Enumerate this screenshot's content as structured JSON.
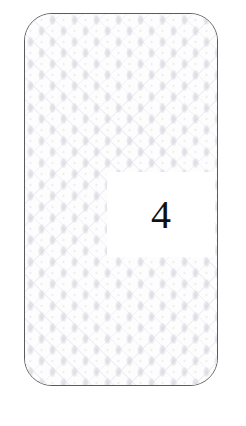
{
  "canvas": {
    "width": 246,
    "height": 426,
    "background_color": "#ffffff"
  },
  "card": {
    "name": "patterned-rounded-card",
    "border_color": "#5a5a5f",
    "fill_color": "#fdfdfe",
    "pattern_name": "diamond-damask-lattice",
    "pattern_color": "#d6d6de",
    "corner_radius": 28
  },
  "label_panel": {
    "background_color": "#ffffff",
    "value": "4",
    "value_color": "#111111"
  }
}
